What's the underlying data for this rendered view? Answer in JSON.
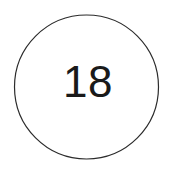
{
  "badge": {
    "value": "18",
    "shape": "circle",
    "stroke_color": "#2b2b2b",
    "stroke_width": 1.2,
    "fill_color": "#ffffff",
    "text_color": "#1a1a1a",
    "center_x": 86.5,
    "center_y": 87,
    "radius": 72,
    "text_center_x": 88,
    "text_baseline_y": 97
  },
  "canvas": {
    "background": "#ffffff",
    "width": 174,
    "height": 175
  }
}
